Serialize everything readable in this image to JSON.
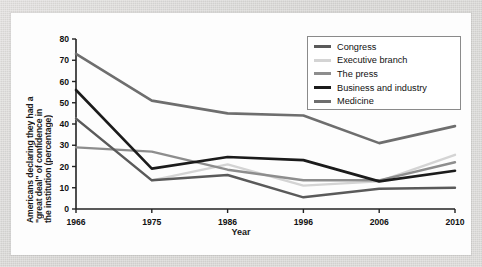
{
  "chart_data": {
    "type": "line",
    "title": "",
    "xlabel": "Year",
    "ylabel": "Americans declaring they had a \"great deal\" of confidence in the institution (percentage)",
    "ylabel_lines": [
      "Americans declaring they had a",
      "\"great deal\" of confidence in",
      "the institution (percentage)"
    ],
    "categories": [
      "1966",
      "1975",
      "1986",
      "1996",
      "2006",
      "2010"
    ],
    "x": [
      1966,
      1975,
      1986,
      1996,
      2006,
      2010
    ],
    "ylim": [
      0,
      80
    ],
    "yticks": [
      0,
      10,
      20,
      30,
      40,
      50,
      60,
      70,
      80
    ],
    "grid": false,
    "legend_position": "top-right",
    "series": [
      {
        "name": "Congress",
        "color": "#5a5a5a",
        "width": 2.4,
        "values": [
          42.5,
          13.5,
          16,
          5.5,
          9.5,
          10
        ]
      },
      {
        "name": "Executive branch",
        "color": "#d4d4d4",
        "width": 2.4,
        "values": [
          42.5,
          13.5,
          21,
          11,
          13,
          25.5
        ]
      },
      {
        "name": "The press",
        "color": "#8d8d8d",
        "width": 2.4,
        "values": [
          29,
          27,
          18.5,
          13.5,
          13.5,
          22
        ]
      },
      {
        "name": "Business and industry",
        "color": "#1b1b1b",
        "width": 2.6,
        "values": [
          56,
          19,
          24.5,
          23,
          13,
          18
        ]
      },
      {
        "name": "Medicine",
        "color": "#6e6e6e",
        "width": 2.6,
        "values": [
          73,
          51,
          45,
          44,
          31,
          39
        ]
      }
    ]
  },
  "axis": {
    "axis_color": "#222222",
    "tick_labels_y": [
      "0",
      "10",
      "20",
      "30",
      "40",
      "50",
      "60",
      "70",
      "80"
    ],
    "tick_labels_x": [
      "1966",
      "1975",
      "1986",
      "1996",
      "2006",
      "2010"
    ]
  },
  "legend": {
    "items": [
      {
        "label": "Congress",
        "color": "#5a5a5a"
      },
      {
        "label": "Executive branch",
        "color": "#d4d4d4"
      },
      {
        "label": "The press",
        "color": "#8d8d8d"
      },
      {
        "label": "Business and industry",
        "color": "#1b1b1b"
      },
      {
        "label": "Medicine",
        "color": "#6e6e6e"
      }
    ]
  }
}
